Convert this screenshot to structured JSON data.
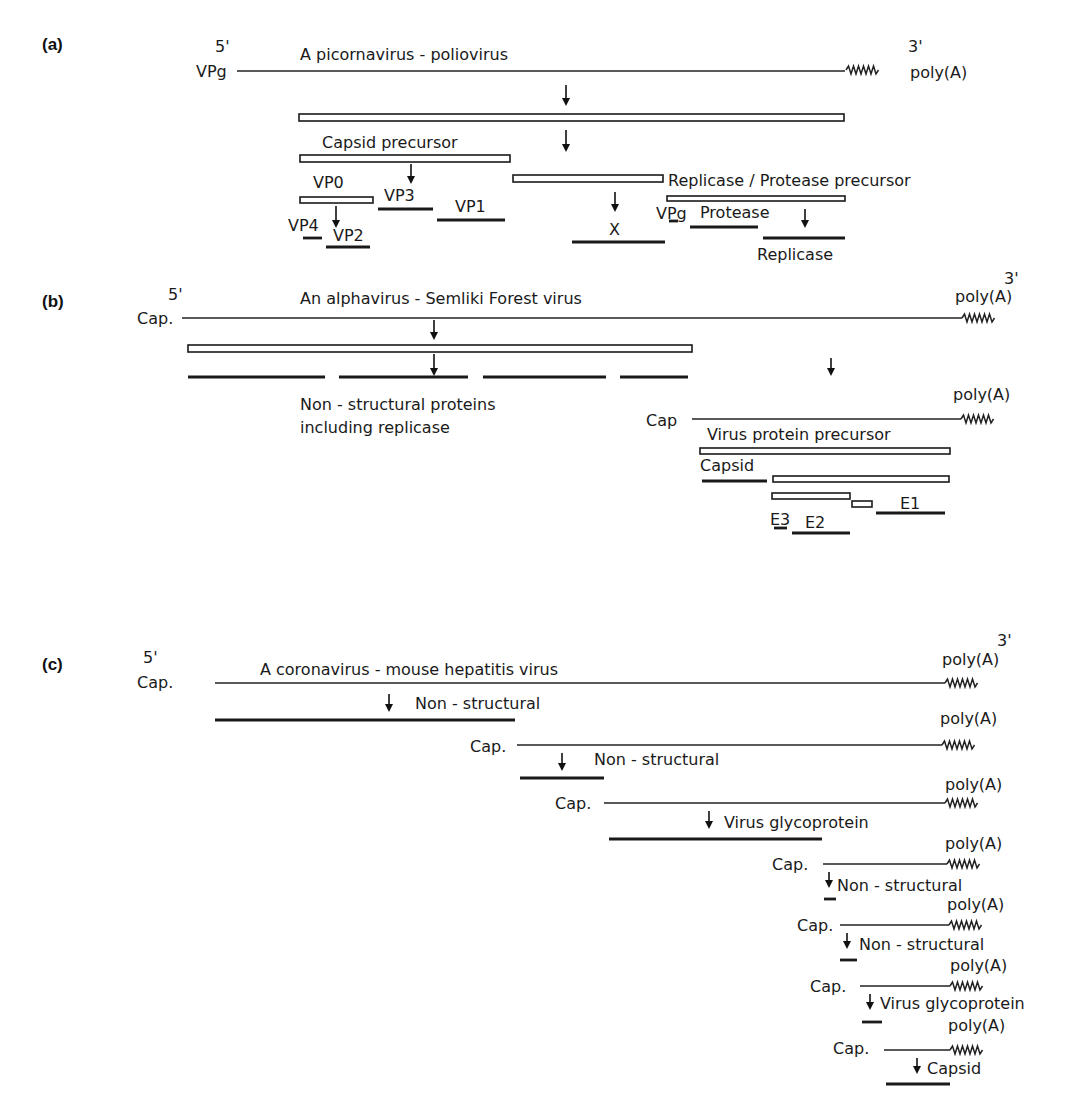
{
  "figure": {
    "panels": [
      {
        "id": "a",
        "label": "(a)",
        "title": "A picornavirus - poliovirus",
        "five_prime": "5'",
        "five_prime_end": "VPg",
        "three_prime": "3'",
        "three_prime_end": "poly(A)",
        "products": {
          "polyprotein": "",
          "capsid_precursor": "Capsid precursor",
          "vp0": "VP0",
          "vp3": "VP3",
          "vp1": "VP1",
          "vp4": "VP4",
          "vp2": "VP2",
          "x": "X",
          "rep_prot_precursor": "Replicase / Protease precursor",
          "vpg": "VPg",
          "protease": "Protease",
          "replicase": "Replicase"
        }
      },
      {
        "id": "b",
        "label": "(b)",
        "title": "An alphavirus - Semliki Forest virus",
        "five_prime": "5'",
        "five_prime_end": "Cap.",
        "three_prime": "3'",
        "three_prime_end": "poly(A)",
        "nonstructural_label_1": "Non - structural proteins",
        "nonstructural_label_2": "including replicase",
        "subgenomic_cap": "Cap",
        "subgenomic_poly": "poly(A)",
        "products": {
          "precursor": "Virus protein precursor",
          "capsid": "Capsid",
          "e3": "E3",
          "e2": "E2",
          "e1": "E1"
        }
      },
      {
        "id": "c",
        "label": "(c)",
        "title": "A coronavirus - mouse hepatitis virus",
        "five_prime": "5'",
        "five_prime_end": "Cap.",
        "three_prime": "3'",
        "three_prime_end": "poly(A)",
        "mrnas": [
          {
            "cap": "Cap.",
            "poly": "poly(A)",
            "product": "Non - structural"
          },
          {
            "cap": "Cap.",
            "poly": "poly(A)",
            "product": "Non - structural"
          },
          {
            "cap": "Cap.",
            "poly": "poly(A)",
            "product": "Virus glycoprotein"
          },
          {
            "cap": "Cap.",
            "poly": "poly(A)",
            "product": "Non - structural"
          },
          {
            "cap": "Cap.",
            "poly": "poly(A)",
            "product": "Non - structural"
          },
          {
            "cap": "Cap.",
            "poly": "poly(A)",
            "product": "Virus glycoprotein"
          },
          {
            "cap": "Cap.",
            "poly": "poly(A)",
            "product": "Capsid"
          }
        ]
      }
    ]
  }
}
